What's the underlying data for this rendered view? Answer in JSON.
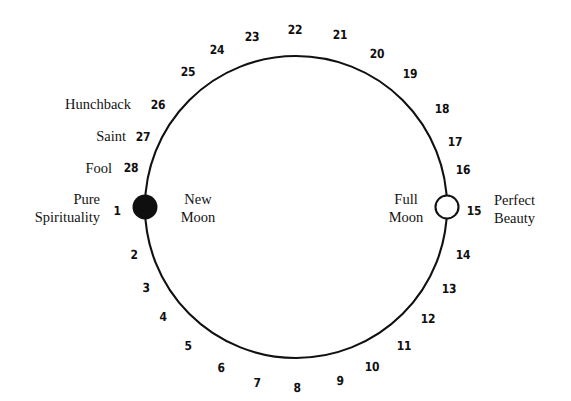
{
  "figure": {
    "kind": "lunar-cycle-diagram",
    "days_total": 28,
    "stroke_color": "#111111",
    "background_color": "#ffffff"
  },
  "circle": {
    "cx": 296,
    "cy": 207,
    "r": 151,
    "stroke_width": 2.1
  },
  "markers": [
    {
      "name": "new-moon-marker",
      "type": "filled-disc",
      "day": 1,
      "cx": 145,
      "cy": 207,
      "r": 12.5,
      "fill": "#100f0f"
    },
    {
      "name": "full-moon-marker",
      "type": "open-circle",
      "day": 15,
      "cx": 447,
      "cy": 207,
      "r": 11.5,
      "fill": "#ffffff"
    }
  ],
  "numbers": [
    {
      "label": "1",
      "x": 117,
      "y": 211
    },
    {
      "label": "2",
      "x": 134,
      "y": 255
    },
    {
      "label": "3",
      "x": 146,
      "y": 288
    },
    {
      "label": "4",
      "x": 163,
      "y": 317
    },
    {
      "label": "5",
      "x": 188,
      "y": 346
    },
    {
      "label": "6",
      "x": 221,
      "y": 368
    },
    {
      "label": "7",
      "x": 257,
      "y": 383
    },
    {
      "label": "8",
      "x": 297,
      "y": 388
    },
    {
      "label": "9",
      "x": 340,
      "y": 381
    },
    {
      "label": "10",
      "x": 372,
      "y": 367
    },
    {
      "label": "11",
      "x": 404,
      "y": 346
    },
    {
      "label": "12",
      "x": 428,
      "y": 319
    },
    {
      "label": "13",
      "x": 449,
      "y": 289
    },
    {
      "label": "14",
      "x": 463,
      "y": 255
    },
    {
      "label": "15",
      "x": 474,
      "y": 211
    },
    {
      "label": "16",
      "x": 463,
      "y": 170
    },
    {
      "label": "17",
      "x": 455,
      "y": 142
    },
    {
      "label": "18",
      "x": 442,
      "y": 109
    },
    {
      "label": "19",
      "x": 410,
      "y": 74
    },
    {
      "label": "20",
      "x": 377,
      "y": 54
    },
    {
      "label": "21",
      "x": 340,
      "y": 35
    },
    {
      "label": "22",
      "x": 295,
      "y": 30
    },
    {
      "label": "23",
      "x": 252,
      "y": 37
    },
    {
      "label": "24",
      "x": 217,
      "y": 50
    },
    {
      "label": "25",
      "x": 188,
      "y": 72
    },
    {
      "label": "26",
      "x": 158,
      "y": 105
    },
    {
      "label": "27",
      "x": 143,
      "y": 137
    },
    {
      "label": "28",
      "x": 131,
      "y": 168
    }
  ],
  "phase_labels": [
    {
      "name": "new-moon-label",
      "lines": [
        "New",
        "Moon"
      ],
      "x": 198,
      "y": 209,
      "align": "center"
    },
    {
      "name": "full-moon-label",
      "lines": [
        "Full",
        "Moon"
      ],
      "x": 406,
      "y": 209,
      "align": "center"
    }
  ],
  "side_labels": [
    {
      "name": "hunchback-label",
      "lines": [
        "Hunchback"
      ],
      "x": 131,
      "y": 105,
      "align": "right"
    },
    {
      "name": "saint-label",
      "lines": [
        "Saint"
      ],
      "x": 126,
      "y": 137,
      "align": "right"
    },
    {
      "name": "fool-label",
      "lines": [
        "Fool"
      ],
      "x": 112,
      "y": 169,
      "align": "right"
    },
    {
      "name": "pure-spirituality-label",
      "lines": [
        "Pure",
        "Spirituality"
      ],
      "x": 100,
      "y": 209,
      "align": "right"
    },
    {
      "name": "perfect-beauty-label",
      "lines": [
        "Perfect",
        "Beauty"
      ],
      "x": 494,
      "y": 210,
      "align": "left"
    }
  ]
}
